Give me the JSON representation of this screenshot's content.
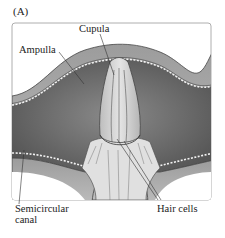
{
  "figure": {
    "panel_label": "(A)",
    "labels": {
      "cupula": "Cupula",
      "ampulla": "Ampulla",
      "semicircular_canal_line1": "Semicircular",
      "semicircular_canal_line2": "canal",
      "hair_cells": "Hair cells"
    },
    "colors": {
      "background": "#ffffff",
      "frame_border": "#9a9a9a",
      "canal_wall": "#a8a8a8",
      "lumen": "#6e6e6e",
      "cupula": "#cfcfcf",
      "crista_base": "#e2e2e2",
      "text": "#222222"
    }
  }
}
